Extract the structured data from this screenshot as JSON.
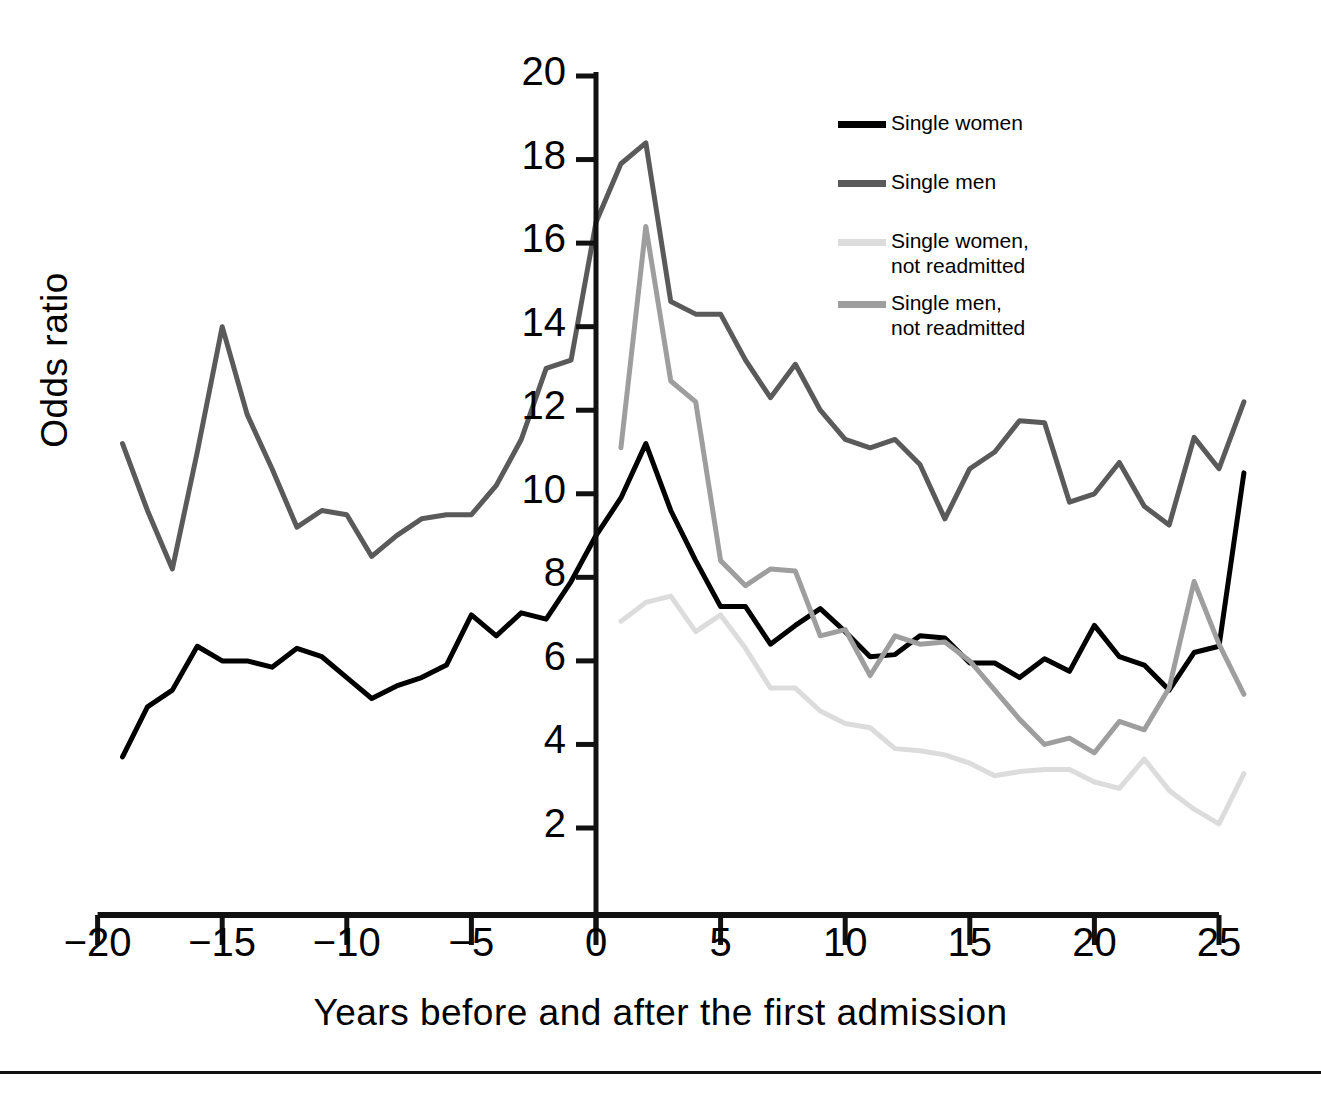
{
  "chart_data": {
    "type": "line",
    "title": "",
    "xlabel": "Years before and after the first admission",
    "ylabel": "Odds ratio",
    "xlim": [
      -20,
      26.5
    ],
    "ylim": [
      1.0,
      20.6
    ],
    "grid": false,
    "legend_position": "top-right",
    "xticks": [
      -20,
      -15,
      -10,
      -5,
      0,
      5,
      10,
      15,
      20,
      25
    ],
    "xticklabels": [
      "−20",
      "−15",
      "−10",
      "−5",
      "0",
      "5",
      "10",
      "15",
      "20",
      "25"
    ],
    "yticks": [
      2,
      4,
      6,
      8,
      10,
      12,
      14,
      16,
      18,
      20
    ],
    "yticklabels": [
      "2",
      "4",
      "6",
      "8",
      "10",
      "12",
      "14",
      "16",
      "18",
      "20"
    ],
    "annotations": [
      "Vertical reference line at year 0 marking the first admission"
    ],
    "series": [
      {
        "name": "Single women",
        "color": "#000000",
        "width": 5,
        "x": [
          -19,
          -18,
          -17,
          -16,
          -15,
          -14,
          -13,
          -12,
          -11,
          -10,
          -9,
          -8,
          -7,
          -6,
          -5,
          -4,
          -3,
          -2,
          -1,
          0,
          1,
          2,
          3,
          4,
          5,
          6,
          7,
          8,
          9,
          10,
          11,
          12,
          13,
          14,
          15,
          16,
          17,
          18,
          19,
          20,
          21,
          22,
          23,
          24,
          25,
          26
        ],
        "y": [
          3.7,
          4.9,
          5.3,
          6.35,
          6.0,
          6.0,
          5.85,
          6.3,
          6.1,
          5.6,
          5.1,
          5.4,
          5.6,
          5.9,
          7.1,
          6.6,
          7.15,
          7.0,
          7.9,
          9.0,
          9.9,
          11.2,
          9.6,
          8.4,
          7.3,
          7.3,
          6.4,
          6.85,
          7.25,
          6.7,
          6.1,
          6.15,
          6.6,
          6.55,
          5.95,
          5.95,
          5.6,
          6.05,
          5.75,
          6.85,
          6.1,
          5.9,
          5.3,
          6.2,
          6.35,
          10.5
        ]
      },
      {
        "name": "Single men",
        "color": "#5a5a5a",
        "width": 5,
        "x": [
          -19,
          -18,
          -17,
          -16,
          -15,
          -14,
          -13,
          -12,
          -11,
          -10,
          -9,
          -8,
          -7,
          -6,
          -5,
          -4,
          -3,
          -2,
          -1,
          0,
          1,
          2,
          3,
          4,
          5,
          6,
          7,
          8,
          9,
          10,
          11,
          12,
          13,
          14,
          15,
          16,
          17,
          18,
          19,
          20,
          21,
          22,
          23,
          24,
          25,
          26
        ],
        "y": [
          11.2,
          9.6,
          8.2,
          11.0,
          14.0,
          11.9,
          10.6,
          9.2,
          9.6,
          9.5,
          8.5,
          9.0,
          9.4,
          9.5,
          9.5,
          10.2,
          11.3,
          13.0,
          13.2,
          16.5,
          17.9,
          18.4,
          14.6,
          14.3,
          14.3,
          13.2,
          12.3,
          13.1,
          12.0,
          11.3,
          11.1,
          11.3,
          10.7,
          9.4,
          10.6,
          11.0,
          11.75,
          11.7,
          9.8,
          10.0,
          10.75,
          9.7,
          9.25,
          11.35,
          10.6,
          12.2
        ]
      },
      {
        "name": "Single women, not readmitted",
        "color": "#dcdcdc",
        "width": 5,
        "x": [
          1,
          2,
          3,
          4,
          5,
          6,
          7,
          8,
          9,
          10,
          11,
          12,
          13,
          14,
          15,
          16,
          17,
          18,
          19,
          20,
          21,
          22,
          23,
          24,
          25,
          26
        ],
        "y": [
          6.95,
          7.4,
          7.55,
          6.7,
          7.1,
          6.3,
          5.35,
          5.35,
          4.8,
          4.5,
          4.4,
          3.9,
          3.85,
          3.75,
          3.55,
          3.25,
          3.35,
          3.4,
          3.4,
          3.1,
          2.95,
          3.65,
          2.9,
          2.45,
          2.1,
          3.3
        ]
      },
      {
        "name": "Single men, not readmitted",
        "color": "#9e9e9e",
        "width": 5,
        "x": [
          1,
          2,
          3,
          4,
          5,
          6,
          7,
          8,
          9,
          10,
          11,
          12,
          13,
          14,
          15,
          16,
          17,
          18,
          19,
          20,
          21,
          22,
          23,
          24,
          25,
          26
        ],
        "y": [
          11.1,
          16.4,
          12.7,
          12.2,
          8.4,
          7.8,
          8.2,
          8.15,
          6.6,
          6.75,
          5.65,
          6.6,
          6.4,
          6.45,
          6.0,
          5.3,
          4.6,
          4.0,
          4.15,
          3.8,
          4.55,
          4.35,
          5.35,
          7.9,
          6.4,
          5.2
        ]
      }
    ]
  },
  "legend": {
    "items": [
      {
        "label": "Single women",
        "color": "#000000"
      },
      {
        "label": "Single men",
        "color": "#5a5a5a"
      },
      {
        "label": "Single women,\nnot readmitted",
        "color": "#dcdcdc"
      },
      {
        "label": "Single men,\nnot readmitted",
        "color": "#9e9e9e"
      }
    ]
  },
  "axes": {
    "x_title": "Years before and after the first admission",
    "y_title": "Odds ratio"
  }
}
